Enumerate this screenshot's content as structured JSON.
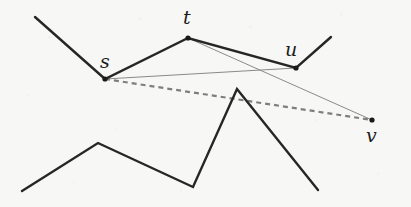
{
  "figure": {
    "canvas": {
      "width": 411,
      "height": 207
    },
    "background_color": "#f8f8f6",
    "ink_color": "#262626",
    "thin_line_color": "#8a8a8a",
    "dashed_line_color": "#7e7e7e",
    "vertex_color": "#1a1a1a"
  },
  "labels": [
    {
      "id": "s",
      "text": "s",
      "x": 100,
      "y": 52,
      "font_size": 19
    },
    {
      "id": "t",
      "text": "t",
      "x": 183,
      "y": 8,
      "font_size": 19
    },
    {
      "id": "u",
      "text": "u",
      "x": 285,
      "y": 40,
      "font_size": 19
    },
    {
      "id": "v",
      "text": "v",
      "x": 366,
      "y": 126,
      "font_size": 19
    }
  ],
  "vertices": [
    {
      "id": "s",
      "x": 105,
      "y": 79,
      "r": 2.6
    },
    {
      "id": "t",
      "x": 188,
      "y": 38,
      "r": 2.6
    },
    {
      "id": "u",
      "x": 296,
      "y": 68,
      "r": 2.6
    },
    {
      "id": "v",
      "x": 372,
      "y": 120,
      "r": 2.6
    }
  ],
  "paths": {
    "upper_obstacle": {
      "name": "upper-polyline",
      "stroke": "#262626",
      "stroke_width": 2.4,
      "dashed": false,
      "points": [
        [
          35,
          17
        ],
        [
          105,
          79
        ],
        [
          188,
          38
        ],
        [
          296,
          68
        ],
        [
          331,
          37
        ]
      ]
    },
    "lower_obstacle": {
      "name": "lower-polyline",
      "stroke": "#262626",
      "stroke_width": 2.4,
      "dashed": false,
      "points": [
        [
          22,
          191
        ],
        [
          98,
          143
        ],
        [
          193,
          187
        ],
        [
          237,
          89
        ],
        [
          318,
          190
        ]
      ]
    },
    "visibility_s_u": {
      "name": "visibility-segment-s-u",
      "stroke": "#8a8a8a",
      "stroke_width": 1.0,
      "dashed": false,
      "points": [
        [
          105,
          79
        ],
        [
          296,
          68
        ]
      ]
    },
    "visibility_t_v": {
      "name": "visibility-segment-t-v",
      "stroke": "#8a8a8a",
      "stroke_width": 1.0,
      "dashed": false,
      "points": [
        [
          188,
          38
        ],
        [
          372,
          120
        ]
      ]
    },
    "shortest_path_s_v": {
      "name": "dashed-segment-s-v",
      "stroke": "#7e7e7e",
      "stroke_width": 2.2,
      "dashed": true,
      "dash_pattern": "5 4",
      "points": [
        [
          105,
          79
        ],
        [
          372,
          120
        ]
      ]
    }
  }
}
